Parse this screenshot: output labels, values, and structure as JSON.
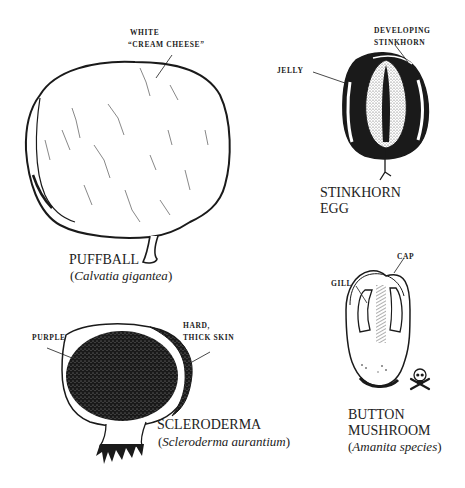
{
  "diagram": {
    "colors": {
      "ink": "#1a1a1a",
      "paper": "#ffffff"
    },
    "specimens": [
      {
        "id": "puffball",
        "name": "PUFFBALL",
        "scientific_name": "Calvatia gigantea",
        "labels": [
          {
            "line1": "WHITE",
            "line2": "“CREAM CHEESE”"
          }
        ]
      },
      {
        "id": "stinkhorn-egg",
        "name_line1": "STINKHORN",
        "name_line2": "EGG",
        "labels": [
          {
            "text": "JELLY"
          },
          {
            "line1": "DEVELOPING",
            "line2": "STINKHORN"
          }
        ]
      },
      {
        "id": "button-mushroom",
        "name_line1": "BUTTON",
        "name_line2": "MUSHROOM",
        "scientific_name": "Amanita species",
        "labels": [
          {
            "text": "GILL"
          },
          {
            "text": "CAP"
          }
        ],
        "warning_icon": "skull-and-crossbones"
      },
      {
        "id": "scleroderma",
        "name": "SCLERODERMA",
        "scientific_name": "Scleroderma aurantium",
        "labels": [
          {
            "text": "PURPLE"
          },
          {
            "line1": "HARD,",
            "line2": "THICK SKIN"
          }
        ]
      }
    ]
  }
}
